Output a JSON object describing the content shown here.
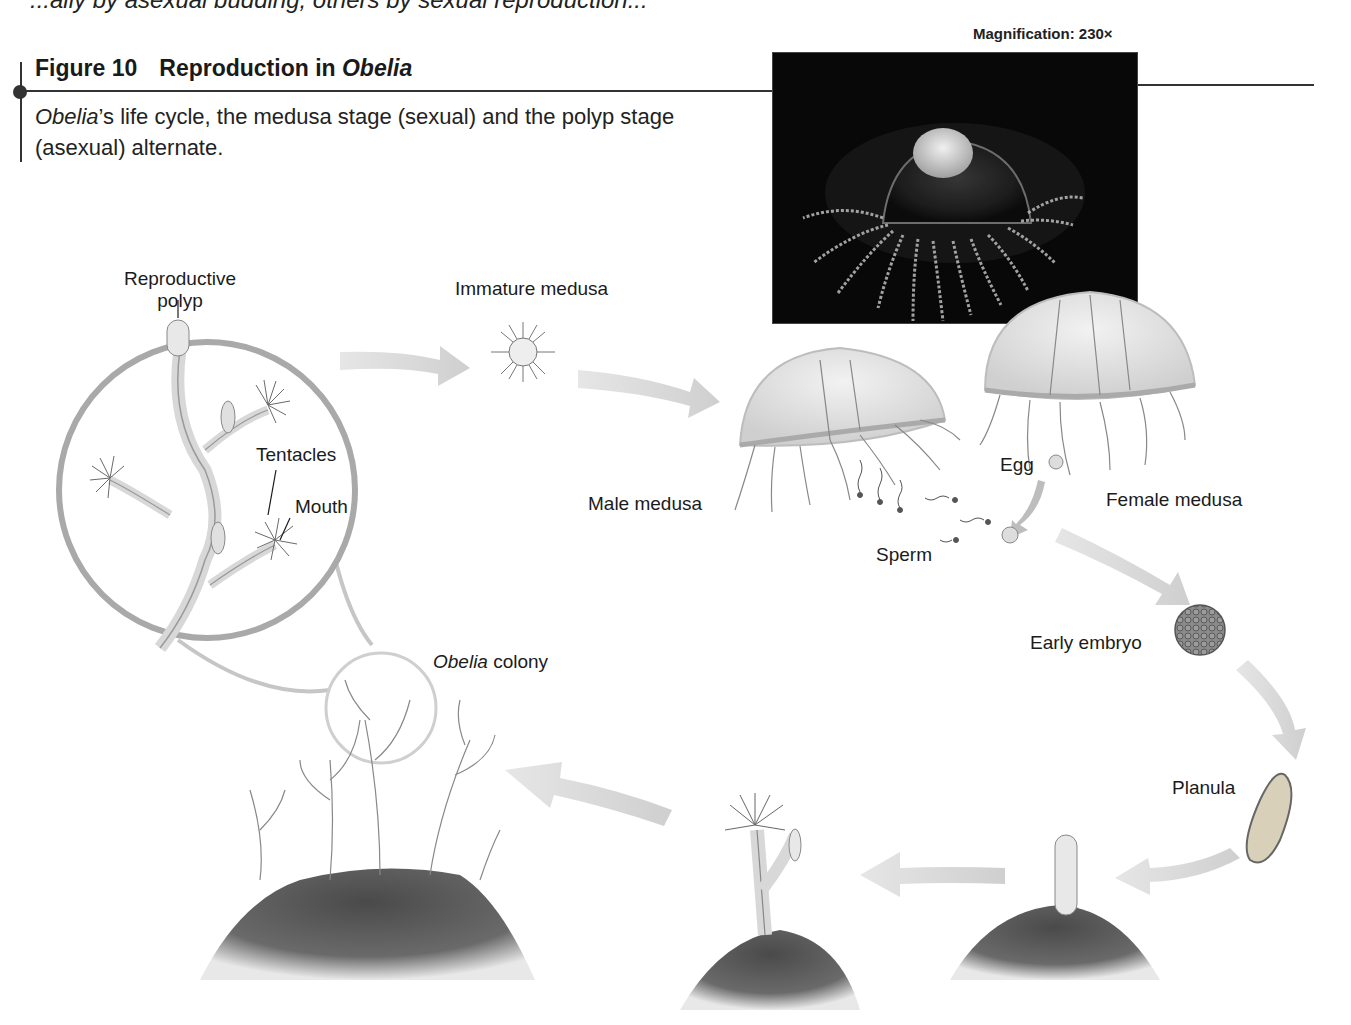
{
  "page": {
    "top_fragment": "...ally by asexual budding, others by sexual reproduction..."
  },
  "figure": {
    "number": "Figure 10",
    "title_prefix": "Reproduction in ",
    "title_italic": "Obelia",
    "caption_italic": "Obelia",
    "caption_rest": "’s life cycle, the medusa stage (sexual) and the polyp stage (asexual) alternate."
  },
  "photo": {
    "magnification": "Magnification: 230×",
    "description": "Micrograph of an Obelia medusa"
  },
  "labels": {
    "reproductive_polyp_line1": "Reproductive",
    "reproductive_polyp_line2": "polyp",
    "tentacles": "Tentacles",
    "mouth": "Mouth",
    "immature_medusa": "Immature medusa",
    "male_medusa": "Male medusa",
    "female_medusa": "Female medusa",
    "egg": "Egg",
    "sperm": "Sperm",
    "early_embryo": "Early embryo",
    "planula": "Planula",
    "obelia_colony_italic": "Obelia",
    "obelia_colony_rest": " colony"
  },
  "colors": {
    "arrow": "#d4d4d4",
    "ink": "#1b1b1b",
    "loupe_ring": "#a9a9a9",
    "substrate": "#5a5a5a",
    "photo_bg": "#080808"
  },
  "life_cycle_stages": [
    "Reproductive polyp",
    "Immature medusa",
    "Male medusa / Female medusa",
    "Egg + Sperm",
    "Early embryo",
    "Planula",
    "Young polyp",
    "Budding polyp",
    "Obelia colony"
  ]
}
